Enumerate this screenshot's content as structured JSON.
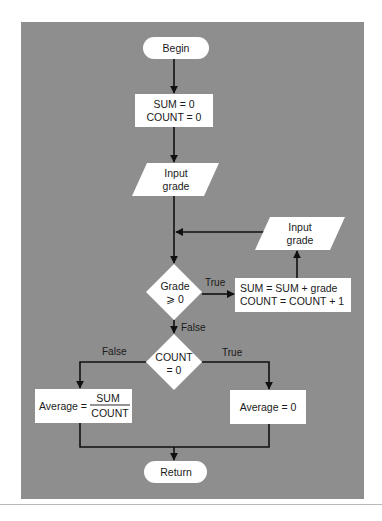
{
  "diagram": {
    "type": "flowchart",
    "background_color": "#8e8e8e",
    "node_fill": "#ffffff",
    "line_color": "#111111",
    "nodes": {
      "begin": {
        "shape": "terminal",
        "text": "Begin"
      },
      "init": {
        "shape": "process",
        "lines": [
          "SUM = 0",
          "COUNT = 0"
        ]
      },
      "input1": {
        "shape": "io",
        "lines": [
          "Input",
          "grade"
        ]
      },
      "decision_grade": {
        "shape": "decision",
        "lines": [
          "Grade",
          "⩾ 0"
        ]
      },
      "accumulate": {
        "shape": "process",
        "lines": [
          "SUM = SUM + grade",
          "COUNT = COUNT + 1"
        ]
      },
      "input2": {
        "shape": "io",
        "lines": [
          "Input",
          "grade"
        ]
      },
      "decision_count": {
        "shape": "decision",
        "lines": [
          "COUNT",
          "= 0"
        ]
      },
      "avg_compute": {
        "shape": "process",
        "prefix": "Average =",
        "numerator": "SUM",
        "denominator": "COUNT"
      },
      "avg_zero": {
        "shape": "process",
        "text": "Average = 0"
      },
      "return": {
        "shape": "terminal",
        "text": "Return"
      }
    },
    "edge_labels": {
      "grade_true": "True",
      "grade_false": "False",
      "count_false": "False",
      "count_true": "True"
    },
    "edges": [
      {
        "from": "begin",
        "to": "init"
      },
      {
        "from": "init",
        "to": "input1"
      },
      {
        "from": "input1",
        "to": "decision_grade"
      },
      {
        "from": "decision_grade",
        "to": "accumulate",
        "label": "True"
      },
      {
        "from": "accumulate",
        "to": "input2"
      },
      {
        "from": "input2",
        "to": "decision_grade"
      },
      {
        "from": "decision_grade",
        "to": "decision_count",
        "label": "False"
      },
      {
        "from": "decision_count",
        "to": "avg_compute",
        "label": "False"
      },
      {
        "from": "decision_count",
        "to": "avg_zero",
        "label": "True"
      },
      {
        "from": "avg_compute",
        "to": "return"
      },
      {
        "from": "avg_zero",
        "to": "return"
      }
    ]
  }
}
